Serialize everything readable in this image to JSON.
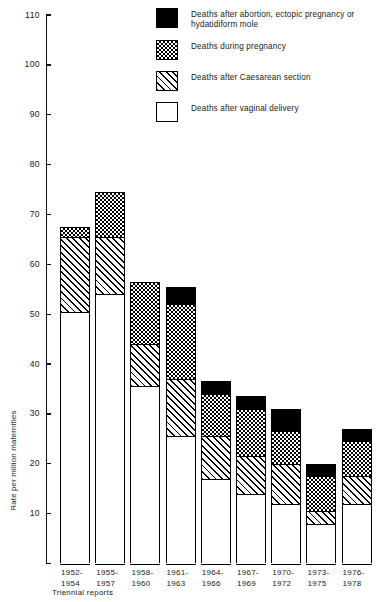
{
  "chart_data": {
    "type": "bar",
    "subtype": "stacked-bar",
    "title": "",
    "xlabel": "Triennial reports",
    "ylabel": "Rate per million maternities",
    "ylim": [
      0,
      110
    ],
    "ytick_interval": 10,
    "yticks": [
      0,
      10,
      20,
      30,
      40,
      50,
      60,
      70,
      80,
      90,
      100,
      110
    ],
    "ytick_labels": [
      "",
      "10",
      "20",
      "30",
      "40",
      "50",
      "60",
      "70",
      "80",
      "90",
      "100",
      "110"
    ],
    "grid": false,
    "legend_position": "top-right",
    "categories": [
      "1952-\n1954",
      "1955-\n1957",
      "1958-\n1960",
      "1961-\n1963",
      "1964-\n1966",
      "1967-\n1969",
      "1970-\n1972",
      "1973-\n1975",
      "1976-\n1978"
    ],
    "series": [
      {
        "name": "Deaths after vaginal delivery",
        "fill": "open",
        "values": [
          50.5,
          54.0,
          35.5,
          25.5,
          17.0,
          14.0,
          12.0,
          8.0,
          12.0
        ]
      },
      {
        "name": "Deaths after Caesarean section",
        "fill": "hatch",
        "values": [
          15.0,
          11.5,
          8.5,
          11.5,
          8.5,
          7.5,
          8.0,
          2.5,
          5.5
        ]
      },
      {
        "name": "Deaths during pregnancy",
        "fill": "check",
        "values": [
          2.0,
          9.0,
          12.5,
          15.0,
          8.5,
          9.5,
          6.5,
          7.0,
          7.0
        ]
      },
      {
        "name": "Deaths after abortion, ectopic pregnancy or hydatidiform mole",
        "fill": "solid",
        "values": [
          0.0,
          0.0,
          0.0,
          3.5,
          2.5,
          2.5,
          4.5,
          2.5,
          2.5
        ]
      }
    ],
    "totals": [
      67.5,
      74.5,
      56.5,
      55.5,
      36.5,
      33.5,
      31.0,
      20.0,
      27.0
    ]
  },
  "legend": {
    "items": [
      {
        "fill": "solid",
        "label": "Deaths after abortion, ectopic pregnancy or hydatidiform mole"
      },
      {
        "fill": "check",
        "label": "Deaths during pregnancy"
      },
      {
        "fill": "hatch",
        "label": "Deaths after Caesarean section"
      },
      {
        "fill": "open",
        "label": "Deaths after vaginal delivery"
      }
    ]
  },
  "axes": {
    "y_title": "Rate per million maternities",
    "x_title": "Triennial reports"
  },
  "colors": {
    "ink": "#000000",
    "background": "#ffffff"
  }
}
